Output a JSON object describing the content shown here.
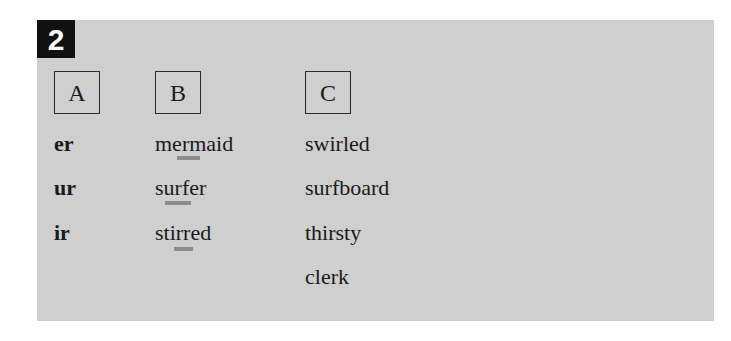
{
  "exercise": {
    "number": "2",
    "columns": [
      {
        "header": "A",
        "items": [
          "er",
          "ur",
          "ir"
        ]
      },
      {
        "header": "B",
        "items": [
          "mermaid",
          "surfer",
          "stirred"
        ],
        "underlined": [
          "er",
          "ur",
          "ir"
        ]
      },
      {
        "header": "C",
        "items": [
          "swirled",
          "surfboard",
          "thirsty",
          "clerk"
        ]
      }
    ]
  },
  "colors": {
    "panel_background": "#cfcfcf",
    "badge_background": "#111111",
    "badge_text": "#ffffff",
    "underline": "#8c8c8c"
  }
}
